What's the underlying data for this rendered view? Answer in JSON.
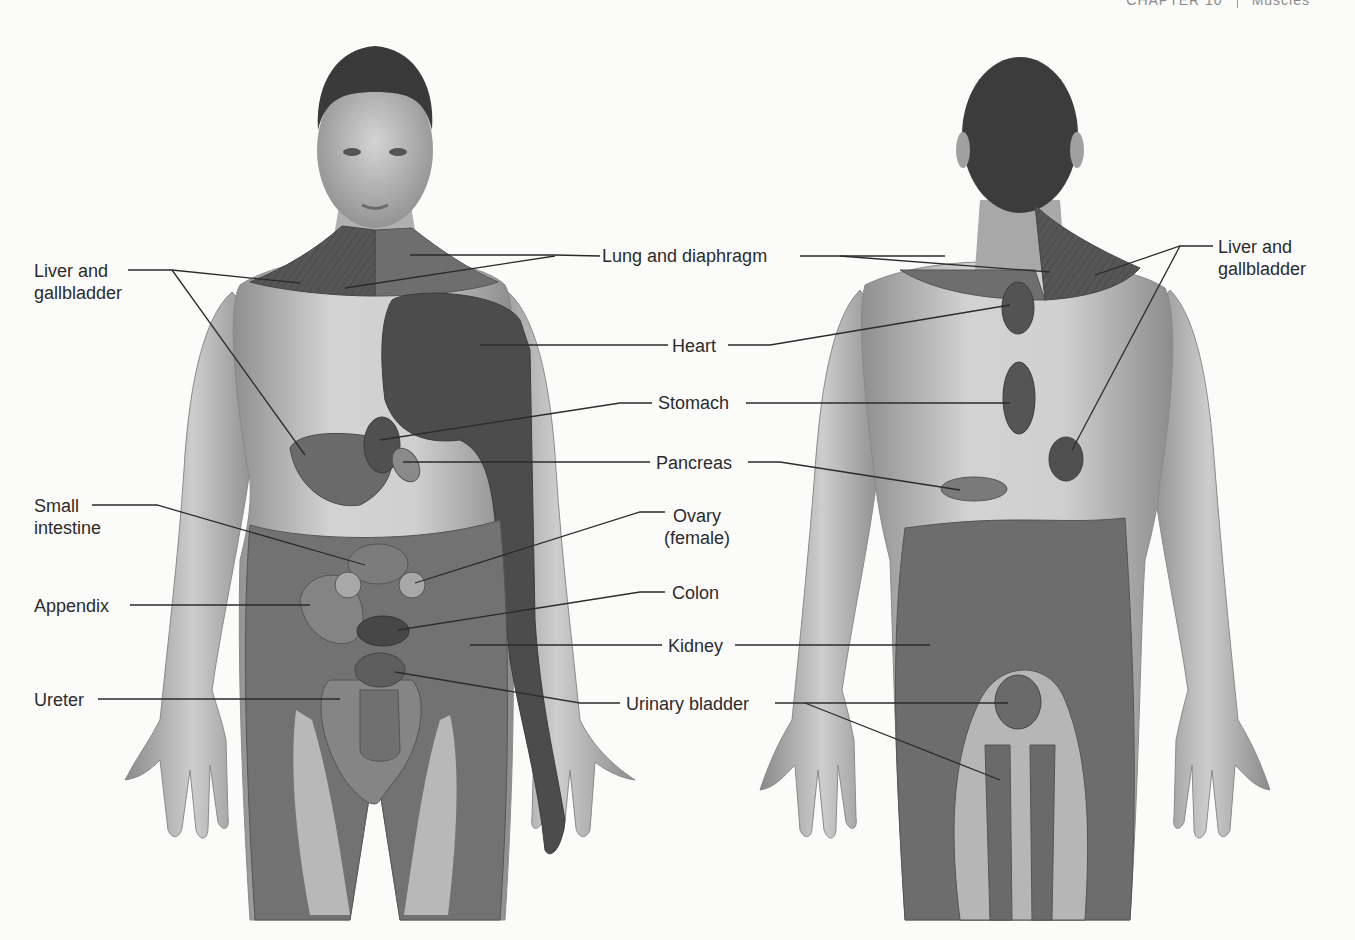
{
  "page_header": {
    "chapter": "CHAPTER 10",
    "section": "Muscles"
  },
  "figure": {
    "views": [
      {
        "id": "anterior",
        "description": "Front view of male body"
      },
      {
        "id": "posterior",
        "description": "Back view of male body"
      }
    ],
    "colors": {
      "skin": "#c9c9c9",
      "skin_shadow": "#9b9b9b",
      "hair": "#3a3a3a",
      "region_medium": "#6f6f6f",
      "region_dark": "#4d4d4d",
      "region_light": "#8e8e8e",
      "region_pale": "#a9a9a9",
      "leader_line": "#2b2b2b"
    }
  },
  "labels": {
    "front_left": {
      "liver_gallbladder": "Liver and\ngallbladder",
      "small_intestine": "Small\nintestine",
      "appendix": "Appendix",
      "ureter": "Ureter"
    },
    "center": {
      "lung_diaphragm": "Lung and diaphragm",
      "heart": "Heart",
      "stomach": "Stomach",
      "pancreas": "Pancreas",
      "ovary": "Ovary\n(female)",
      "colon": "Colon",
      "kidney": "Kidney",
      "urinary_bladder": "Urinary bladder"
    },
    "back_right": {
      "liver_gallbladder": "Liver and\ngallbladder"
    }
  }
}
